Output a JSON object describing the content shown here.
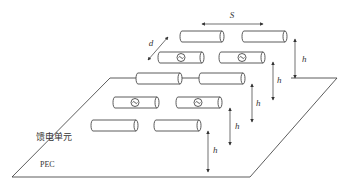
{
  "diagram": {
    "labels": {
      "spacing": "S",
      "depth": "d",
      "height": "h",
      "feed_unit": "馈电单元",
      "ground_plane": "PEC"
    },
    "colors": {
      "line": "#333333",
      "background": "#ffffff"
    },
    "rows": [
      {
        "row": 1,
        "elements": [
          "parasitic",
          "parasitic"
        ]
      },
      {
        "row": 2,
        "elements": [
          "fed",
          "fed"
        ]
      },
      {
        "row": 3,
        "elements": [
          "parasitic",
          "parasitic"
        ]
      },
      {
        "row": 4,
        "elements": [
          "fed",
          "fed"
        ]
      },
      {
        "row": 5,
        "elements": [
          "parasitic",
          "parasitic"
        ]
      }
    ],
    "source_icon": "ac-source-icon"
  }
}
